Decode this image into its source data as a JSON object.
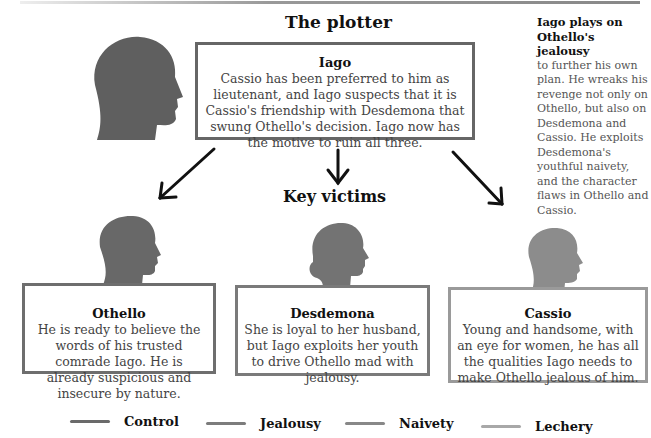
{
  "headings": {
    "plotter": "The plotter",
    "victims": "Key victims"
  },
  "plotter": {
    "name": "Iago",
    "description": "Cassio has been preferred to him as lieutenant, and Iago suspects that it is Cassio's friendship with Desdemona that swung Othello's decision. Iago now has the motive to ruin all three.",
    "border_color": "#666666"
  },
  "sidebar": {
    "title": "Iago plays on Othello's jealousy",
    "body": "to further his own plan. He wreaks his revenge not only on Othello, but also on Desdemona and Cassio. He exploits Desdemona's youthful naivety, and the character flaws in Othello and Cassio."
  },
  "victims": [
    {
      "name": "Othello",
      "description": "He is ready to believe the words of his trusted comrade Iago. He is already suspicious and insecure by nature.",
      "border_color": "#6e6e6e"
    },
    {
      "name": "Desdemona",
      "description": "She is loyal to her husband, but Iago exploits her youth to drive Othello mad with jealousy.",
      "border_color": "#7a7a7a"
    },
    {
      "name": "Cassio",
      "description": "Young and handsome, with an eye for women, he has all the qualities Iago needs to make Othello jealous of him.",
      "border_color": "#9a9a9a"
    }
  ],
  "legend": [
    {
      "label": "Control",
      "color": "#6a6a6a"
    },
    {
      "label": "Jealousy",
      "color": "#7c7c7c"
    },
    {
      "label": "Naivety",
      "color": "#888888"
    },
    {
      "label": "Lechery",
      "color": "#a8a8a8"
    }
  ],
  "colors": {
    "iago_head": "#5f5f5f",
    "othello_head": "#686868",
    "desdemona_head": "#737373",
    "cassio_head": "#8c8c8c"
  }
}
